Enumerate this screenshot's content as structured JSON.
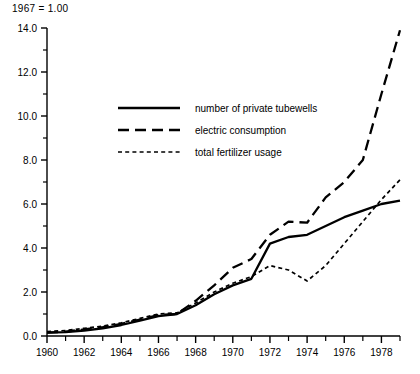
{
  "header": {
    "note": "1967 = 1.00"
  },
  "chart_data": {
    "type": "line",
    "title": "",
    "subtitle": "1967 = 1.00",
    "xlabel": "",
    "ylabel": "",
    "xlim": [
      1960,
      1979
    ],
    "ylim": [
      0.0,
      14.0
    ],
    "grid": false,
    "legend_position": "upper-center-left",
    "y_ticks": [
      "0.0",
      "2.0",
      "4.0",
      "6.0",
      "8.0",
      "10.0",
      "12.0",
      "14.0"
    ],
    "y_tick_values": [
      0,
      2,
      4,
      6,
      8,
      10,
      12,
      14
    ],
    "y_minor_tick_values": [
      1,
      3,
      5,
      7,
      9,
      11,
      13
    ],
    "x_ticks": [
      "1960",
      "1962",
      "1964",
      "1966",
      "1968",
      "1970",
      "1972",
      "1974",
      "1976",
      "1978"
    ],
    "x_tick_values": [
      1960,
      1962,
      1964,
      1966,
      1968,
      1970,
      1972,
      1974,
      1976,
      1978
    ],
    "x_minor_tick_values": [
      1961,
      1963,
      1965,
      1967,
      1969,
      1971,
      1973,
      1975,
      1977,
      1979
    ],
    "x": [
      1960,
      1961,
      1962,
      1963,
      1964,
      1965,
      1966,
      1967,
      1968,
      1969,
      1970,
      1971,
      1972,
      1973,
      1974,
      1975,
      1976,
      1977,
      1978,
      1979
    ],
    "series": [
      {
        "name": "number of private tubewells",
        "style": "solid",
        "color": "#000000",
        "values": [
          0.15,
          0.18,
          0.25,
          0.35,
          0.5,
          0.7,
          0.9,
          1.0,
          1.4,
          1.9,
          2.3,
          2.6,
          4.2,
          4.5,
          4.6,
          5.0,
          5.4,
          5.7,
          6.0,
          6.15
        ]
      },
      {
        "name": "electric consumption",
        "style": "dashed",
        "color": "#000000",
        "values": [
          0.15,
          0.2,
          0.3,
          0.4,
          0.55,
          0.75,
          0.95,
          1.0,
          1.6,
          2.3,
          3.1,
          3.5,
          4.6,
          5.2,
          5.15,
          6.3,
          7.0,
          8.0,
          11.0,
          13.9
        ]
      },
      {
        "name": "total fertilizer usage",
        "style": "dotted",
        "color": "#000000",
        "values": [
          0.2,
          0.25,
          0.35,
          0.45,
          0.6,
          0.8,
          1.0,
          1.05,
          1.5,
          2.0,
          2.4,
          2.7,
          3.2,
          3.0,
          2.5,
          3.2,
          4.2,
          5.2,
          6.2,
          7.1
        ]
      }
    ]
  },
  "legend": {
    "items": [
      {
        "label": "number of private tubewells",
        "style": "solid"
      },
      {
        "label": "electric consumption",
        "style": "dashed"
      },
      {
        "label": "total fertilizer usage",
        "style": "dotted"
      }
    ]
  }
}
